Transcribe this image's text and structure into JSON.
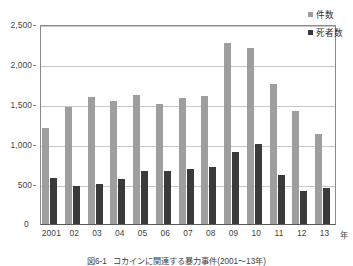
{
  "chart_data": {
    "type": "bar",
    "title": "",
    "caption_number": "図6-1",
    "caption_text": "コカインに関連する暴力事件(2001～13年)",
    "xlabel": "年",
    "ylabel": "",
    "categories": [
      "2001",
      "02",
      "03",
      "04",
      "05",
      "06",
      "07",
      "08",
      "09",
      "10",
      "11",
      "12",
      "13"
    ],
    "ylim": [
      0,
      2500
    ],
    "y_ticks": [
      0,
      500,
      1000,
      1500,
      2000,
      2500
    ],
    "y_tick_labels": [
      "0",
      "500",
      "1,000",
      "1,500",
      "2,000",
      "2,500"
    ],
    "grid": true,
    "legend_position": "top-right",
    "series": [
      {
        "name": "件数",
        "color": "#9e9e9e",
        "values": [
          1200,
          1460,
          1590,
          1540,
          1610,
          1505,
          1570,
          1595,
          2265,
          2205,
          1745,
          1410,
          1130
        ]
      },
      {
        "name": "死者数",
        "color": "#3a3a3a",
        "values": [
          570,
          480,
          495,
          565,
          665,
          660,
          685,
          710,
          895,
          1000,
          610,
          415,
          450
        ]
      }
    ]
  },
  "legend": {
    "items": [
      {
        "label": "件数",
        "swatch": "legend-swatch-cases"
      },
      {
        "label": "死者数",
        "swatch": "legend-swatch-deaths"
      }
    ]
  },
  "axis": {
    "zero_label": "0",
    "unit_label": "年"
  }
}
